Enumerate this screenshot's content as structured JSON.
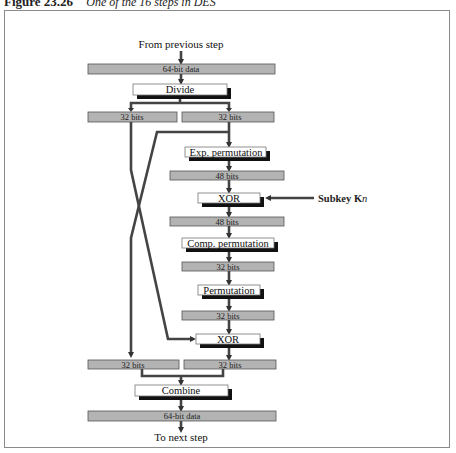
{
  "caption": {
    "figure": "Figure 23.26",
    "text": "One of the 16 steps in DES"
  },
  "labels": {
    "from_previous": "From previous step",
    "to_next": "To next step",
    "subkey": "Subkey K",
    "subkey_sub": "n"
  },
  "boxes": {
    "data_in": "64-bit data",
    "divide": "Divide",
    "left_32": "32 bits",
    "right_32": "32 bits",
    "exp_perm": "Exp. permutation",
    "bits48_a": "48 bits",
    "xor1": "XOR",
    "bits48_b": "48 bits",
    "comp_perm": "Comp. permutation",
    "bits32_a": "32 bits",
    "permutation": "Permutation",
    "bits32_b": "32 bits",
    "xor2": "XOR",
    "left_32_out": "32 bits",
    "right_32_out": "32 bits",
    "combine": "Combine",
    "data_out": "64-bit data"
  },
  "colors": {
    "gray_box": "#b3b3b3",
    "line": "#444444",
    "shadow": "#111111",
    "frame": "#8a8a8a"
  }
}
